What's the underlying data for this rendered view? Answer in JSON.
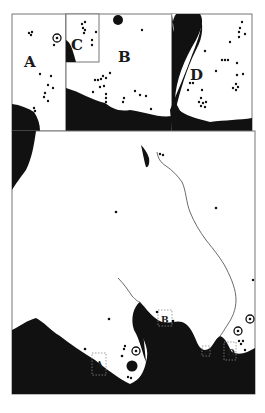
{
  "map": {
    "type": "archaeological site distribution map with inset panels",
    "colors": {
      "land": "#ffffff",
      "sea": "#111111",
      "frame": "#777777",
      "dot": "#111111"
    },
    "insets": [
      {
        "id": "A",
        "label": "A"
      },
      {
        "id": "B",
        "label": "B"
      },
      {
        "id": "C",
        "label": "C"
      },
      {
        "id": "D",
        "label": "D"
      }
    ],
    "main_map_labels": [
      {
        "id": "A",
        "label": "A"
      },
      {
        "id": "B",
        "label": "B"
      },
      {
        "id": "C",
        "label": "C"
      },
      {
        "id": "D",
        "label": "D"
      }
    ],
    "legend_symbols": [
      "site-dot",
      "ringed-site",
      "large-site-disc"
    ]
  }
}
